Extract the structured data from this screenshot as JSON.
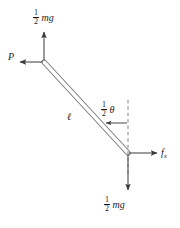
{
  "figure": {
    "type": "free-body-diagram",
    "stroke_color": "#555555",
    "text_color": "#1a1a1a",
    "background_color": "#ffffff",
    "caption_text": "",
    "labels": {
      "top_weight": {
        "fraction_numerator": "1",
        "fraction_denominator": "2",
        "term": "mg"
      },
      "bottom_weight": {
        "fraction_numerator": "1",
        "fraction_denominator": "2",
        "term": "mg"
      },
      "applied_force": "P",
      "rod_length": "ℓ",
      "angle": {
        "fraction_numerator": "1",
        "fraction_denominator": "2",
        "term": "θ"
      },
      "friction_force": {
        "base": "f",
        "subscript": "x"
      }
    },
    "geometry": {
      "rod_top_end": [
        44,
        62
      ],
      "rod_bottom_end": [
        128,
        153
      ],
      "rod_width": 5,
      "dashed_line_x": 128,
      "dashed_line_top_y": 100,
      "dashed_line_bottom_y": 176,
      "arrow_up_from": [
        44,
        60
      ],
      "arrow_up_to": [
        44,
        31
      ],
      "arrow_left_from": [
        42,
        62
      ],
      "arrow_left_to": [
        18,
        62
      ],
      "arrow_down_from": [
        128,
        155
      ],
      "arrow_down_to": [
        128,
        190
      ],
      "arrow_right_from": [
        130,
        153
      ],
      "arrow_right_to": [
        157,
        153
      ],
      "angle_arrow_from": [
        128,
        123
      ],
      "angle_arrow_to": [
        105,
        123
      ]
    }
  }
}
